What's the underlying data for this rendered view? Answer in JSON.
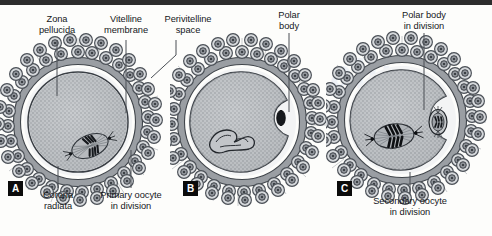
{
  "figure": {
    "background_color": "#fdfdfb",
    "ink_color": "#3c4147",
    "zona_color": "#8c9096",
    "cytoplasm_color": "#b9bcc0",
    "panel_tag_bg": "#0b0b0b",
    "panel_tag_fg": "#ffffff"
  },
  "labels": {
    "zona_pellucida": "Zona\npellucida",
    "zona_pellucida_line1": "Zona",
    "zona_pellucida_line2": "pellucida",
    "vitelline_membrane_line1": "Vitelline",
    "vitelline_membrane_line2": "membrane",
    "perivitelline_space_line1": "Perivitelline",
    "perivitelline_space_line2": "space",
    "polar_body_line1": "Polar",
    "polar_body_line2": "body",
    "polar_body_in_division_line1": "Polar body",
    "polar_body_in_division_line2": "in division",
    "corona_radiata_line1": "Corona",
    "corona_radiata_line2": "radiata",
    "primary_oocyte_line1": "Primary oocyte",
    "primary_oocyte_line2": "in division",
    "secondary_oocyte_line1": "Secondary oocyte",
    "secondary_oocyte_line2": "in division"
  },
  "panels": [
    {
      "tag": "A",
      "caption": "Primary oocyte in division",
      "callouts": [
        "Zona pellucida",
        "Vitelline membrane",
        "Perivitelline space",
        "Corona radiata",
        "Primary oocyte in division"
      ],
      "features": {
        "spindle": true,
        "chromosomes": true,
        "polar_body": false,
        "cytoplasm_indentation": false
      }
    },
    {
      "tag": "B",
      "caption": "",
      "callouts": [
        "Polar body"
      ],
      "features": {
        "spindle": false,
        "chromosomes": true,
        "polar_body": true,
        "cytoplasm_indentation": true
      }
    },
    {
      "tag": "C",
      "caption": "Secondary oocyte in division",
      "callouts": [
        "Polar body in division",
        "Secondary oocyte in division"
      ],
      "features": {
        "spindle": true,
        "chromosomes": true,
        "polar_body": true,
        "polar_body_dividing": true,
        "cytoplasm_indentation": true
      }
    }
  ],
  "watermark": "alue"
}
